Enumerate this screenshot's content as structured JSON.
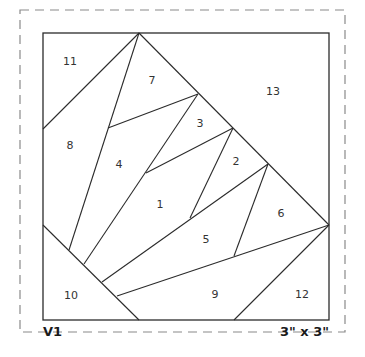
{
  "pattern": {
    "version_label": "V1",
    "size_label": "3\" x 3\"",
    "colors": {
      "line": "#2b2b2b",
      "dashed_border": "#8a8a8a",
      "background": "#ffffff",
      "text": "#333333"
    },
    "pieces": [
      {
        "number": "1",
        "x": 160,
        "y": 205
      },
      {
        "number": "2",
        "x": 236,
        "y": 162
      },
      {
        "number": "3",
        "x": 200,
        "y": 124
      },
      {
        "number": "4",
        "x": 119,
        "y": 165
      },
      {
        "number": "5",
        "x": 206,
        "y": 240
      },
      {
        "number": "6",
        "x": 281,
        "y": 214
      },
      {
        "number": "7",
        "x": 152,
        "y": 81
      },
      {
        "number": "8",
        "x": 70,
        "y": 146
      },
      {
        "number": "9",
        "x": 215,
        "y": 295
      },
      {
        "number": "10",
        "x": 71,
        "y": 296
      },
      {
        "number": "11",
        "x": 70,
        "y": 62
      },
      {
        "number": "12",
        "x": 302,
        "y": 295
      },
      {
        "number": "13",
        "x": 273,
        "y": 92
      }
    ]
  }
}
